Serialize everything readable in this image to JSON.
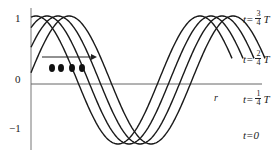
{
  "axis": {
    "y_tick_labels": [
      "1",
      "0",
      "−1"
    ],
    "x_axis_label": "r"
  },
  "curves": [
    {
      "label_prefix": "t=",
      "numerator": "3",
      "denominator": "4",
      "suffix": "T",
      "phase_shift_px": 33
    },
    {
      "label_prefix": "t=",
      "numerator": "2",
      "denominator": "4",
      "suffix": "T",
      "phase_shift_px": 22
    },
    {
      "label_prefix": "t=",
      "numerator": "1",
      "denominator": "4",
      "suffix": "T",
      "phase_shift_px": 11
    },
    {
      "label_prefix": "t=",
      "value": "0",
      "phase_shift_px": 0
    }
  ],
  "annotations": {
    "propagation_arrow": "right",
    "particle_dots": 4
  },
  "colors": {
    "line": "#1a1a1a",
    "axis": "#555555"
  }
}
